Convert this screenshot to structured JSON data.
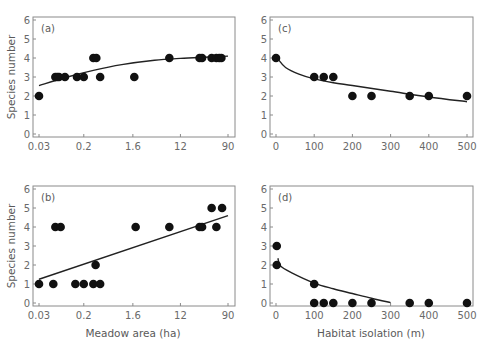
{
  "chart_data": [
    {
      "id": "a",
      "panel_label": "(a)",
      "type": "scatter",
      "xscale": "log",
      "xlabel": "",
      "ylabel": "Species number",
      "xticks": [
        0.03,
        0.2,
        1.6,
        12,
        90
      ],
      "xtick_labels": [
        "0.03",
        "0.2",
        "1.6",
        "12",
        "90"
      ],
      "yticks": [
        0,
        1,
        2,
        3,
        4,
        5,
        6
      ],
      "xlim": [
        0.03,
        90
      ],
      "ylim": [
        0,
        6
      ],
      "points": [
        {
          "x": 0.03,
          "y": 2
        },
        {
          "x": 0.06,
          "y": 3
        },
        {
          "x": 0.065,
          "y": 3
        },
        {
          "x": 0.07,
          "y": 3
        },
        {
          "x": 0.09,
          "y": 3
        },
        {
          "x": 0.15,
          "y": 3
        },
        {
          "x": 0.2,
          "y": 3
        },
        {
          "x": 0.3,
          "y": 4
        },
        {
          "x": 0.34,
          "y": 4
        },
        {
          "x": 0.4,
          "y": 3
        },
        {
          "x": 1.7,
          "y": 3
        },
        {
          "x": 7.5,
          "y": 4
        },
        {
          "x": 27,
          "y": 4
        },
        {
          "x": 30,
          "y": 4
        },
        {
          "x": 45,
          "y": 4
        },
        {
          "x": 55,
          "y": 4
        },
        {
          "x": 62,
          "y": 4
        },
        {
          "x": 68,
          "y": 4
        }
      ],
      "fit": {
        "type": "curve",
        "points": [
          [
            0.03,
            2.55
          ],
          [
            0.1,
            3.0
          ],
          [
            0.3,
            3.35
          ],
          [
            1.0,
            3.65
          ],
          [
            4.0,
            3.88
          ],
          [
            12,
            3.98
          ],
          [
            40,
            4.05
          ],
          [
            90,
            4.1
          ]
        ]
      }
    },
    {
      "id": "b",
      "panel_label": "(b)",
      "type": "scatter",
      "xscale": "log",
      "xlabel": "Meadow area (ha)",
      "ylabel": "Species number",
      "xticks": [
        0.03,
        0.2,
        1.6,
        12,
        90
      ],
      "xtick_labels": [
        "0.03",
        "0.2",
        "1.6",
        "12",
        "90"
      ],
      "yticks": [
        0,
        1,
        2,
        3,
        4,
        5,
        6
      ],
      "xlim": [
        0.03,
        90
      ],
      "ylim": [
        0,
        6
      ],
      "points": [
        {
          "x": 0.03,
          "y": 1
        },
        {
          "x": 0.055,
          "y": 1
        },
        {
          "x": 0.06,
          "y": 4
        },
        {
          "x": 0.075,
          "y": 4
        },
        {
          "x": 0.14,
          "y": 1
        },
        {
          "x": 0.2,
          "y": 1
        },
        {
          "x": 0.3,
          "y": 1
        },
        {
          "x": 0.33,
          "y": 2
        },
        {
          "x": 0.4,
          "y": 1
        },
        {
          "x": 1.8,
          "y": 4
        },
        {
          "x": 7.5,
          "y": 4
        },
        {
          "x": 27,
          "y": 4
        },
        {
          "x": 30,
          "y": 4
        },
        {
          "x": 45,
          "y": 5
        },
        {
          "x": 55,
          "y": 4
        },
        {
          "x": 70,
          "y": 5
        }
      ],
      "fit": {
        "type": "line",
        "points": [
          [
            0.03,
            1.25
          ],
          [
            90,
            4.6
          ]
        ]
      }
    },
    {
      "id": "c",
      "panel_label": "(c)",
      "type": "scatter",
      "xscale": "linear",
      "xlabel": "",
      "ylabel": "",
      "xticks": [
        0,
        100,
        200,
        300,
        400,
        500
      ],
      "xtick_labels": [
        "0",
        "100",
        "200",
        "300",
        "400",
        "500"
      ],
      "yticks": [
        0,
        1,
        2,
        3,
        4,
        5,
        6
      ],
      "xlim": [
        0,
        500
      ],
      "ylim": [
        0,
        6
      ],
      "points": [
        {
          "x": 0,
          "y": 4
        },
        {
          "x": 100,
          "y": 3
        },
        {
          "x": 125,
          "y": 3
        },
        {
          "x": 150,
          "y": 3
        },
        {
          "x": 200,
          "y": 2
        },
        {
          "x": 250,
          "y": 2
        },
        {
          "x": 350,
          "y": 2
        },
        {
          "x": 400,
          "y": 2
        },
        {
          "x": 500,
          "y": 2
        }
      ],
      "fit": {
        "type": "curve",
        "points": [
          [
            5,
            3.95
          ],
          [
            25,
            3.5
          ],
          [
            60,
            3.15
          ],
          [
            100,
            2.9
          ],
          [
            150,
            2.7
          ],
          [
            200,
            2.55
          ],
          [
            300,
            2.25
          ],
          [
            400,
            1.95
          ],
          [
            500,
            1.7
          ]
        ]
      }
    },
    {
      "id": "d",
      "panel_label": "(d)",
      "type": "scatter",
      "xscale": "linear",
      "xlabel": "Habitat isolation (m)",
      "ylabel": "",
      "xticks": [
        0,
        100,
        200,
        300,
        400,
        500
      ],
      "xtick_labels": [
        "0",
        "100",
        "200",
        "300",
        "400",
        "500"
      ],
      "yticks": [
        0,
        1,
        2,
        3,
        4,
        5,
        6
      ],
      "xlim": [
        0,
        500
      ],
      "ylim": [
        0,
        6
      ],
      "points": [
        {
          "x": 2,
          "y": 3
        },
        {
          "x": 2,
          "y": 2
        },
        {
          "x": 100,
          "y": 1
        },
        {
          "x": 100,
          "y": 0
        },
        {
          "x": 125,
          "y": 0
        },
        {
          "x": 150,
          "y": 0
        },
        {
          "x": 200,
          "y": 0
        },
        {
          "x": 250,
          "y": 0
        },
        {
          "x": 350,
          "y": 0
        },
        {
          "x": 400,
          "y": 0
        },
        {
          "x": 500,
          "y": 0
        }
      ],
      "fit": {
        "type": "curve",
        "points": [
          [
            5,
            2.35
          ],
          [
            12,
            1.95
          ],
          [
            40,
            1.6
          ],
          [
            100,
            1.05
          ],
          [
            150,
            0.75
          ],
          [
            200,
            0.5
          ],
          [
            250,
            0.25
          ],
          [
            300,
            0.02
          ]
        ]
      }
    }
  ],
  "labels": {
    "ylabel_top": "Species number",
    "ylabel_bottom": "Species number",
    "xlabel_left": "Meadow area (ha)",
    "xlabel_right": "Habitat isolation (m)"
  }
}
